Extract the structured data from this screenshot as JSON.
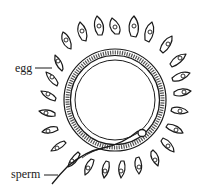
{
  "diagram": {
    "type": "biological-illustration",
    "labels": {
      "egg": "egg",
      "sperm": "sperm"
    },
    "colors": {
      "ink": "#1a1a1a",
      "background": "#ffffff"
    },
    "parts": [
      {
        "name": "corona-radiata-cells",
        "description": "flame-shaped follicle cells with nuclei surrounding the egg"
      },
      {
        "name": "zona-pellucida",
        "description": "thick textured ring around the egg"
      },
      {
        "name": "egg-membrane",
        "description": "inner cell boundary"
      },
      {
        "name": "sperm",
        "description": "sperm head inside the zona, tail extending outward to lower left"
      }
    ]
  }
}
